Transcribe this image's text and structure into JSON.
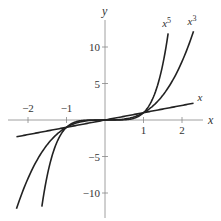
{
  "chart_data": {
    "type": "line",
    "title": "",
    "xlabel": "x",
    "ylabel": "y",
    "xlim": [
      -2.5,
      2.5
    ],
    "ylim": [
      -12.5,
      12.5
    ],
    "grid": false,
    "legend": "inline labels at curve ends",
    "x_ticks": [
      -2,
      -1,
      1,
      2
    ],
    "x_tick_labels": [
      "−2",
      "−1",
      "1",
      "2"
    ],
    "y_ticks": [
      10,
      5,
      -5,
      -10
    ],
    "y_tick_labels": [
      "10",
      "5",
      "−5",
      "−10"
    ],
    "series": [
      {
        "name": "x",
        "label": "x",
        "function": "y = x",
        "x_range": [
          -2.3,
          2.3
        ],
        "points": [
          [
            -2.3,
            -2.3
          ],
          [
            -1,
            -1
          ],
          [
            0,
            0
          ],
          [
            1,
            1
          ],
          [
            2.3,
            2.3
          ]
        ]
      },
      {
        "name": "x^3",
        "label": "x",
        "label_sup": "3",
        "function": "y = x^3",
        "x_range": [
          -2.3,
          2.3
        ],
        "points": [
          [
            -2.3,
            -12.17
          ],
          [
            -2,
            -8
          ],
          [
            -1,
            -1
          ],
          [
            0,
            0
          ],
          [
            1,
            1
          ],
          [
            2,
            8
          ],
          [
            2.3,
            12.17
          ]
        ]
      },
      {
        "name": "x^5",
        "label": "x",
        "label_sup": "5",
        "function": "y = x^5",
        "x_range": [
          -1.64,
          1.64
        ],
        "points": [
          [
            -1.64,
            -11.84
          ],
          [
            -1.5,
            -7.59
          ],
          [
            -1,
            -1
          ],
          [
            0,
            0
          ],
          [
            1,
            1
          ],
          [
            1.5,
            7.59
          ],
          [
            1.64,
            11.84
          ]
        ]
      }
    ],
    "annotations": [
      "Curves intersect at (-1,-1), (0,0), (1,1)"
    ]
  }
}
